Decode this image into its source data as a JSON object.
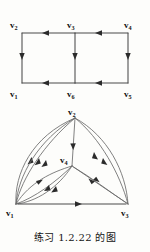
{
  "caption": "练习 1.2.22 的图",
  "figures": [
    {
      "id": "top-graph",
      "name": "directed-grid-graph",
      "vertices": [
        {
          "id": "v2",
          "label": "v",
          "sub": "2",
          "x": 18,
          "y": 28
        },
        {
          "id": "v3",
          "label": "v",
          "sub": "3",
          "x": 75,
          "y": 28
        },
        {
          "id": "v4",
          "label": "v",
          "sub": "4",
          "x": 132,
          "y": 28
        },
        {
          "id": "v1",
          "label": "v",
          "sub": "1",
          "x": 18,
          "y": 88
        },
        {
          "id": "v6",
          "label": "v",
          "sub": "6",
          "x": 75,
          "y": 88
        },
        {
          "id": "v5",
          "label": "v",
          "sub": "5",
          "x": 132,
          "y": 88
        }
      ],
      "edges": [
        {
          "from": "v3",
          "to": "v2",
          "direction": "left"
        },
        {
          "from": "v4",
          "to": "v3",
          "direction": "left"
        },
        {
          "from": "v6",
          "to": "v1",
          "direction": "left"
        },
        {
          "from": "v5",
          "to": "v6",
          "direction": "left"
        },
        {
          "from": "v2",
          "to": "v1",
          "direction": "down"
        },
        {
          "from": "v3",
          "to": "v6",
          "direction": "down"
        },
        {
          "from": "v4",
          "to": "v5",
          "direction": "down"
        }
      ]
    },
    {
      "id": "bottom-graph",
      "name": "multigraph-triangle",
      "vertices": [
        {
          "id": "v2",
          "label": "v",
          "sub": "2",
          "x": 75,
          "y": 8
        },
        {
          "id": "v4",
          "label": "v",
          "sub": "4",
          "x": 72,
          "y": 58
        },
        {
          "id": "v1",
          "label": "v",
          "sub": "1",
          "x": 16,
          "y": 96
        },
        {
          "id": "v3",
          "label": "v",
          "sub": "3",
          "x": 128,
          "y": 96
        }
      ],
      "edges": [
        {
          "from": "v1",
          "to": "v2",
          "kind": "curved",
          "count": 3
        },
        {
          "from": "v1",
          "to": "v4",
          "kind": "curved",
          "count": 2
        },
        {
          "from": "v4",
          "to": "v1",
          "kind": "curved",
          "count": 1
        },
        {
          "from": "v2",
          "to": "v4",
          "kind": "straight",
          "count": 1
        },
        {
          "from": "v4",
          "to": "v3",
          "kind": "straight",
          "count": 1
        },
        {
          "from": "v3",
          "to": "v2",
          "kind": "curved",
          "count": 2
        },
        {
          "from": "v3",
          "to": "v4",
          "kind": "straight",
          "count": 1
        },
        {
          "from": "v1",
          "to": "v3",
          "kind": "straight",
          "count": 1
        }
      ]
    }
  ],
  "colors": {
    "background": "#fdfdfb",
    "edge": "#4a4a4a",
    "arrow": "#2b2b2b",
    "text": "#141414"
  }
}
